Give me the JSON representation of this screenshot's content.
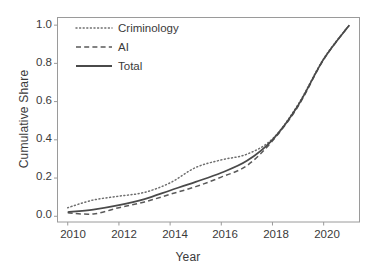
{
  "chart_data": {
    "type": "line",
    "title": "",
    "xlabel": "Year",
    "ylabel": "Cumulative Share",
    "xlim": [
      2009.6,
      2021.4
    ],
    "ylim": [
      -0.03,
      1.04
    ],
    "xticks": [
      "2010",
      "2012",
      "2014",
      "2016",
      "2018",
      "2020"
    ],
    "xtick_values": [
      2010,
      2012,
      2014,
      2016,
      2018,
      2020
    ],
    "yticks": [
      "0.0",
      "0.2",
      "0.4",
      "0.6",
      "0.8",
      "1.0"
    ],
    "ytick_values": [
      0.0,
      0.2,
      0.4,
      0.6,
      0.8,
      1.0
    ],
    "grid": false,
    "legend_position": "top-left-inside",
    "panel_border_color": "#999999",
    "background": "#ffffff",
    "x": [
      2010,
      2011,
      2012,
      2013,
      2014,
      2015,
      2016,
      2017,
      2018,
      2019,
      2020,
      2021
    ],
    "series": [
      {
        "name": "Criminology",
        "style": "dotted",
        "color": "#6e6e6e",
        "values": [
          0.045,
          0.085,
          0.105,
          0.125,
          0.175,
          0.255,
          0.295,
          0.325,
          0.405,
          0.585,
          0.825,
          1.0
        ]
      },
      {
        "name": "AI",
        "style": "dashed",
        "color": "#5a5a5a",
        "values": [
          0.018,
          0.012,
          0.045,
          0.075,
          0.115,
          0.155,
          0.205,
          0.265,
          0.395,
          0.575,
          0.82,
          1.0
        ]
      },
      {
        "name": "Total",
        "style": "solid",
        "color": "#4a4a4a",
        "values": [
          0.022,
          0.035,
          0.058,
          0.09,
          0.135,
          0.18,
          0.228,
          0.29,
          0.4,
          0.58,
          0.822,
          1.0
        ]
      }
    ]
  },
  "axes": {
    "ylabel": "Cumulative Share",
    "xlabel": "Year",
    "ytick_labels": [
      "1.0",
      "0.8",
      "0.6",
      "0.4",
      "0.2",
      "0.0"
    ],
    "xtick_labels": [
      "2010",
      "2012",
      "2014",
      "2016",
      "2018",
      "2020"
    ]
  },
  "legend": {
    "items": [
      {
        "label": "Criminology",
        "style": "dotted"
      },
      {
        "label": "AI",
        "style": "dashed"
      },
      {
        "label": "Total",
        "style": "solid"
      }
    ]
  }
}
